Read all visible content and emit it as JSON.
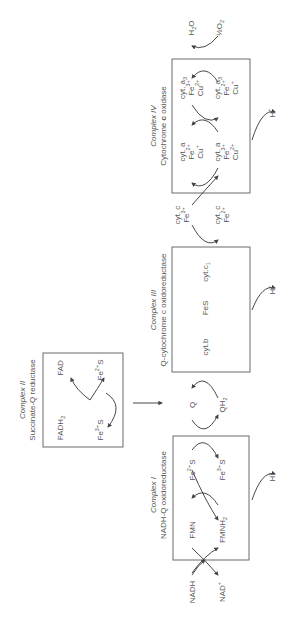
{
  "diagram": {
    "type": "electron-transport-chain",
    "orientation": "rotated-90-ccw",
    "colors": {
      "line": "#6a6a6a",
      "text": "#555555",
      "background": "#ffffff"
    },
    "complex_i": {
      "title": "Complex I",
      "subtitle": "NADH-Q oxidoreductase",
      "inputs": {
        "reduced": "NADH",
        "oxidized": "NAD",
        "oxidized_sup": "+"
      },
      "carriers": [
        {
          "ox": "FMN",
          "red": "FMNH",
          "red_sub": "2"
        },
        {
          "a": "Fe",
          "a_sup": "2+",
          "a_tail": "S",
          "b": "Fe",
          "b_sup": "3+",
          "b_tail": "S"
        }
      ],
      "proton": "H",
      "proton_sup": "+"
    },
    "complex_ii": {
      "title": "Complex II",
      "subtitle": "Succinate-Q reductase",
      "fadh2": "FADH",
      "fadh2_sub": "2",
      "fad": "FAD",
      "fes_top": "Fe",
      "fes_top_sup": "2+",
      "fes_top_tail": "S",
      "fes_bottom": "Fe",
      "fes_bottom_sup": "3+",
      "fes_bottom_tail": "S"
    },
    "quinone": {
      "q": "Q",
      "qh2": "QH",
      "qh2_sub": "2"
    },
    "complex_iii": {
      "title": "Complex III",
      "subtitle": "Q-cytochrome c oxidoreductase",
      "members": {
        "cytb": "cyt.b",
        "fes": "FeS",
        "cytc1": "cyt.c",
        "cytc1_sub": "1"
      },
      "proton": "H",
      "proton_sup": "+"
    },
    "cytochrome_c": {
      "ox_label": "cyt. c",
      "ox_fe": "Fe",
      "ox_sup": "3+",
      "red_label": "cyt. c",
      "red_fe": "Fe",
      "red_sup": "2+"
    },
    "complex_iv": {
      "title": "Complex IV",
      "subtitle_pre": "Cytochrome ",
      "subtitle_bold": "c",
      "subtitle_post": " oxidase",
      "cyt_a_top": {
        "name": "cyt. a",
        "fe": "Fe",
        "fe_sup": "2+",
        "cu": "Cu",
        "cu_sup": "+"
      },
      "cyt_a_bottom": {
        "name": "cyt. a",
        "fe": "Fe",
        "fe_sup": "3+",
        "cu": "Cu",
        "cu_sup": "2+"
      },
      "cyt_a3_top": {
        "name": "cyt. a",
        "name_sub": "3",
        "fe": "Fe",
        "fe_sup": "3+",
        "cu": "Cu",
        "cu_sup": "2+"
      },
      "cyt_a3_bottom": {
        "name": "cyt. a",
        "name_sub": "3",
        "fe": "Fe",
        "fe_sup": "2+",
        "cu": "Cu",
        "cu_sup": "+"
      },
      "water": "H",
      "water_sub": "2",
      "water_tail": "O",
      "oxygen": "½O",
      "oxygen_sub": "2",
      "proton": "H",
      "proton_sup": "+"
    }
  }
}
